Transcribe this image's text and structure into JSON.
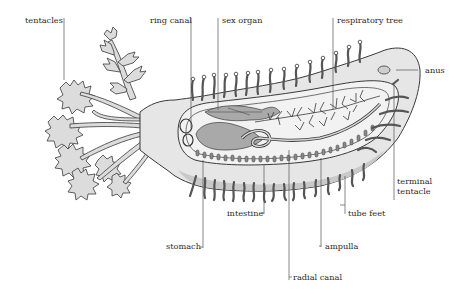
{
  "diagram": {
    "colors": {
      "body_fill": "#e6e6e6",
      "organ_fill": "#a9a9a9",
      "outline": "#3a3a3a",
      "leader_line": "#555555",
      "text": "#2a2a2a"
    },
    "labels": {
      "tentacles": "tentacles",
      "ring_canal": "ring canal",
      "sex_organ": "sex organ",
      "respiratory_tree": "respiratory tree",
      "anus": "anus",
      "terminal_tentacle": "terminal\ntentacle",
      "tube_feet": "tube feet",
      "intestine": "intestine",
      "ampulla": "ampulla",
      "stomach": "stomach",
      "radial_canal": "radial canal"
    }
  }
}
